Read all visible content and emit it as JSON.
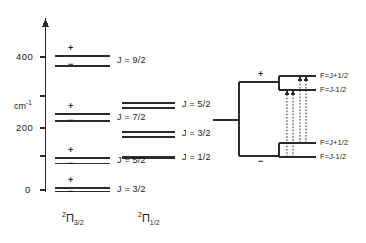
{
  "figure": {
    "axis": {
      "unit_label": "cm",
      "unit_exponent": "-1",
      "ticks": [
        "400",
        "200",
        "0"
      ],
      "tick_values": [
        400,
        200,
        0
      ]
    },
    "columns": [
      {
        "name": "pi-three-halves",
        "term_pre": "2",
        "term_symbol": "Π",
        "term_sub": "3/2",
        "levels": [
          {
            "j": "J = 9/2",
            "energy": 400,
            "split": "wide",
            "parity_upper": "+",
            "parity_lower": "−"
          },
          {
            "j": "J = 7/2",
            "energy": 240,
            "split": "medium",
            "parity_upper": "+",
            "parity_lower": "−"
          },
          {
            "j": "J = 5/2",
            "energy": 110,
            "split": "narrow",
            "parity_upper": "+",
            "parity_lower": "−"
          },
          {
            "j": "J = 3/2",
            "energy": 0,
            "split": "tight",
            "parity_upper": "+",
            "parity_lower": "−"
          }
        ]
      },
      {
        "name": "pi-one-half",
        "term_pre": "2",
        "term_symbol": "Π",
        "term_sub": "1/2",
        "levels": [
          {
            "j": "J = 5/2",
            "energy": 295,
            "split": "narrow"
          },
          {
            "j": "J = 3/2",
            "energy": 195,
            "split": "narrow"
          },
          {
            "j": "J = 1/2",
            "energy": 140,
            "split": "none"
          }
        ]
      }
    ],
    "inset": {
      "name": "lambda-doubling-detail",
      "parity_upper": "+",
      "parity_lower": "−",
      "sublevels": [
        {
          "label": "F=J+1/2",
          "group": "upper"
        },
        {
          "label": "F=J-1/2",
          "group": "upper"
        },
        {
          "label": "F=J+1/2",
          "group": "lower"
        },
        {
          "label": "F=J-1/2",
          "group": "lower"
        }
      ],
      "transitions": 4
    },
    "colors": {
      "ink": "#1a1a1a",
      "line": "#3a3a3a",
      "background": "#ffffff"
    }
  }
}
